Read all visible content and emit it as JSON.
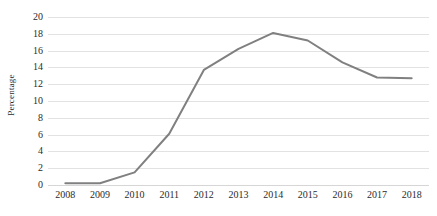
{
  "chart_data": {
    "type": "line",
    "title": "",
    "xlabel": "",
    "ylabel": "Percentage",
    "categories": [
      "2008",
      "2009",
      "2010",
      "2011",
      "2012",
      "2013",
      "2014",
      "2015",
      "2016",
      "2017",
      "2018"
    ],
    "values": [
      0.2,
      0.2,
      1.5,
      6.1,
      13.7,
      16.2,
      18.1,
      17.2,
      14.6,
      12.8,
      12.7
    ],
    "series": [
      {
        "name": "Percentage",
        "color": "#808080",
        "values": [
          0.2,
          0.2,
          1.5,
          6.1,
          13.7,
          16.2,
          18.1,
          17.2,
          14.6,
          12.8,
          12.7
        ]
      }
    ],
    "ylim": [
      0,
      20
    ],
    "yticks": [
      0,
      2,
      4,
      6,
      8,
      10,
      12,
      14,
      16,
      18,
      20
    ],
    "ytick_labels": [
      "0",
      "2",
      "4",
      "6",
      "8",
      "10",
      "12",
      "14",
      "16",
      "18",
      "20"
    ],
    "grid": "horizontal",
    "grid_color": "#e2e2e2",
    "legend": "none",
    "markers": false,
    "line_width": 2,
    "background": "#ffffff"
  }
}
